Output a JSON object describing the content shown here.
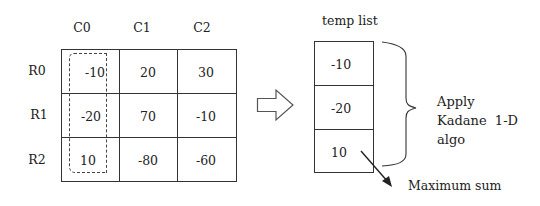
{
  "matrix": {
    "column_headers": [
      "C0",
      "C1",
      "C2"
    ],
    "row_headers": [
      "R0",
      "R1",
      "R2"
    ],
    "rows": [
      [
        "-10",
        "20",
        "30"
      ],
      [
        "-20",
        "70",
        "-10"
      ],
      [
        "10",
        "-80",
        "-60"
      ]
    ],
    "highlighted_column": "C0"
  },
  "temp_list": {
    "title": "temp list",
    "values": [
      "-10",
      "-20",
      "10"
    ]
  },
  "annotation": {
    "lines": [
      "Apply",
      "Kadane  1-D",
      "algo"
    ]
  },
  "result": {
    "label": "Maximum sum"
  }
}
